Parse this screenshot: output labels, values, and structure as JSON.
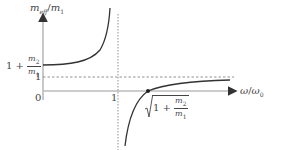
{
  "diagram": {
    "y_axis_label": {
      "num": "m",
      "num_sub": "eff",
      "sep": "/",
      "den": "m",
      "den_sub": "1"
    },
    "x_axis_label": {
      "num": "ω",
      "sep": "/",
      "den": "ω",
      "den_sub": "0"
    },
    "y_ticks": {
      "upper": {
        "prefix": "1 + ",
        "frac_num": "m",
        "frac_num_sub": "2",
        "frac_den": "m",
        "frac_den_sub": "1"
      },
      "one": "1",
      "zero": "0"
    },
    "x_ticks": {
      "one": "1"
    },
    "root_label": {
      "prefix": "1 + ",
      "frac_num": "m",
      "frac_num_sub": "2",
      "frac_den": "m",
      "frac_den_sub": "1"
    },
    "colors": {
      "axis": "#bbbbbb",
      "curve": "#333333",
      "dashed": "#666666",
      "text": "#444444"
    }
  }
}
